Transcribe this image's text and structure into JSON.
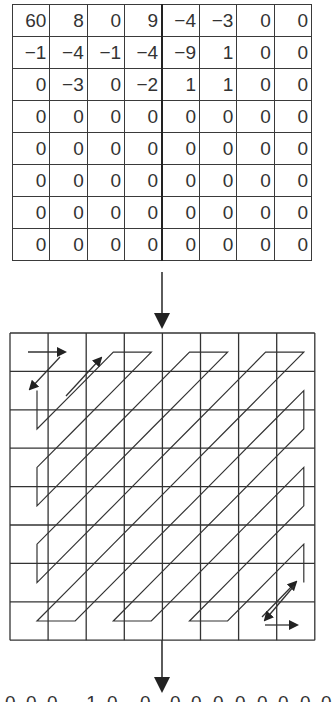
{
  "figure": {
    "title": ""
  },
  "matrix": {
    "rows": [
      [
        "60",
        "8",
        "0",
        "9",
        "−4",
        "−3",
        "0",
        "0"
      ],
      [
        "−1",
        "−4",
        "−1",
        "−4",
        "−9",
        "1",
        "0",
        "0"
      ],
      [
        "0",
        "−3",
        "0",
        "−2",
        "1",
        "1",
        "0",
        "0"
      ],
      [
        "0",
        "0",
        "0",
        "0",
        "0",
        "0",
        "0",
        "0"
      ],
      [
        "0",
        "0",
        "0",
        "0",
        "0",
        "0",
        "0",
        "0"
      ],
      [
        "0",
        "0",
        "0",
        "0",
        "0",
        "0",
        "0",
        "0"
      ],
      [
        "0",
        "0",
        "0",
        "0",
        "0",
        "0",
        "0",
        "0"
      ],
      [
        "0",
        "0",
        "0",
        "0",
        "0",
        "0",
        "0",
        "0"
      ]
    ]
  },
  "zigzag_grid": {
    "rows": 8,
    "cols": 8,
    "scan": "zigzag"
  },
  "output_sequence": {
    "values": [
      "0",
      "0",
      "0",
      "-1",
      "0",
      "0",
      "0",
      "0",
      "0",
      "0",
      "0",
      "0",
      "0",
      "0"
    ],
    "clipped": true
  },
  "colors": {
    "line": "#333333",
    "background": "#ffffff"
  }
}
